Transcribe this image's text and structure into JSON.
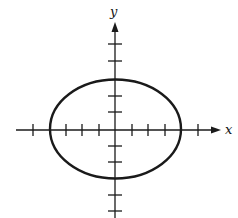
{
  "diagram": {
    "type": "ellipse-on-axes",
    "x_axis_label": "x",
    "y_axis_label": "y",
    "colors": {
      "stroke": "#1a1a1a",
      "background": "#ffffff"
    },
    "ellipse": {
      "center": [
        0,
        0
      ],
      "semi_axis_x": 4,
      "semi_axis_y": 3
    },
    "x_ticks": [
      -5,
      -4,
      -3,
      -2,
      -1,
      1,
      2,
      3,
      4,
      5
    ],
    "y_ticks": [
      -5,
      -4,
      -3,
      -2,
      -1,
      1,
      2,
      3,
      4,
      5
    ]
  }
}
